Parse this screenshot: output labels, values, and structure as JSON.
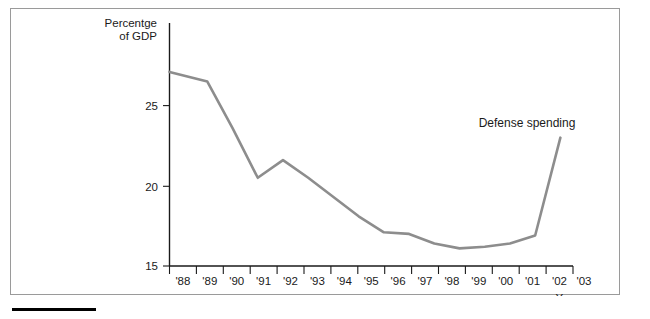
{
  "figure": {
    "has_outer_frame": true,
    "footnote_rule": true,
    "line_color": "#8d8d8d",
    "axis_color": "#1a1a1a",
    "background": "#ffffff"
  },
  "chart_data": {
    "type": "line",
    "title": "",
    "subtitle": "",
    "xlabel": "Year",
    "ylabel_line1": "Percentge",
    "ylabel_line2": "of GDP",
    "ylabel": "Percentge of GDP",
    "categories": [
      "'88",
      "'89",
      "'90",
      "'91",
      "'92",
      "'93",
      "'94",
      "'95",
      "'96",
      "'97",
      "'98",
      "'99",
      "'00",
      "'01",
      "'02",
      "'03"
    ],
    "series": [
      {
        "name": "Defense spending",
        "values": [
          27.1,
          26.5,
          23.6,
          20.5,
          21.6,
          20.5,
          19.3,
          18.1,
          17.1,
          17.0,
          16.4,
          16.1,
          16.2,
          16.4,
          16.9,
          23.0
        ]
      }
    ],
    "annotations": [
      {
        "text": "Defense spending",
        "x_category": "'02",
        "y_value": 24.6
      }
    ],
    "yticks": [
      15,
      20,
      25
    ],
    "ytick_labels": [
      "15",
      "20",
      "25"
    ],
    "ylim": [
      15,
      28.2
    ],
    "grid": false,
    "legend": "none"
  }
}
